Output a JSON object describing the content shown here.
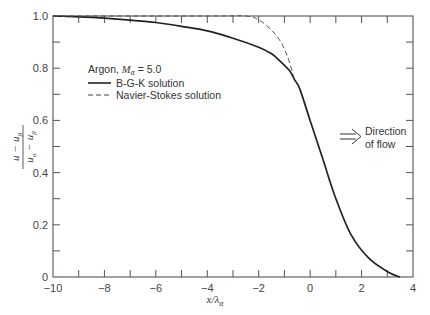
{
  "chart_data": {
    "type": "line",
    "title": "",
    "xlabel": "x/λ_α",
    "ylabel": "(u − u_β)/(u_α − u_β)",
    "xlim": [
      -10,
      4
    ],
    "ylim": [
      0,
      1.0
    ],
    "x_ticks": [
      -10,
      -8,
      -6,
      -4,
      -2,
      0,
      2,
      4
    ],
    "x_tick_labels": [
      "−10",
      "−8",
      "−6",
      "−4",
      "−2",
      "0",
      "2",
      "4"
    ],
    "x_minor_ticks": [
      -9,
      -7,
      -5,
      -3,
      -1,
      1,
      3
    ],
    "y_ticks": [
      0,
      0.2,
      0.4,
      0.6,
      0.8,
      1.0
    ],
    "y_tick_labels": [
      "0",
      "0.2",
      "0.4",
      "0.6",
      "0.8",
      "1.0"
    ],
    "y_minor_ticks": [
      0.1,
      0.3,
      0.5,
      0.7,
      0.9
    ],
    "grid": false,
    "legend": {
      "position": "upper-left-inside",
      "title_prefix": "Argon, ",
      "title_math": "M",
      "title_sub": "α",
      "title_suffix": " = 5.0",
      "entries": [
        "B-G-K solution",
        "Navier-Stokes solution"
      ]
    },
    "annotation": {
      "arrow": "⟹",
      "line1": "Direction",
      "line2": "of flow"
    },
    "series": [
      {
        "name": "B-G-K solution",
        "style": "solid",
        "x": [
          -10,
          -9,
          -8,
          -7,
          -6,
          -5,
          -4,
          -3,
          -2,
          -1.5,
          -1.2,
          -0.8,
          -0.6,
          -0.4,
          0,
          0.5,
          1.0,
          1.6,
          2.3,
          3.1,
          3.5
        ],
        "y": [
          1.0,
          0.997,
          0.992,
          0.984,
          0.975,
          0.96,
          0.943,
          0.915,
          0.88,
          0.855,
          0.83,
          0.79,
          0.755,
          0.72,
          0.6,
          0.45,
          0.3,
          0.16,
          0.07,
          0.015,
          0.0
        ]
      },
      {
        "name": "Navier-Stokes solution",
        "style": "dashed",
        "x": [
          -10,
          -4,
          -2.5,
          -2.0,
          -1.6,
          -1.2,
          -0.9,
          -0.6
        ],
        "y": [
          1.0,
          1.0,
          1.0,
          0.985,
          0.955,
          0.91,
          0.85,
          0.755
        ]
      }
    ]
  },
  "labels": {
    "xlabel_main": "x/λ",
    "xlabel_sub": "α",
    "ylabel_num_a": "u",
    "ylabel_num_b": "u",
    "ylabel_num_sub": "β",
    "ylabel_den_a": "u",
    "ylabel_den_a_sub": "α",
    "ylabel_den_b": "u",
    "ylabel_den_b_sub": "β",
    "minus": "−"
  }
}
